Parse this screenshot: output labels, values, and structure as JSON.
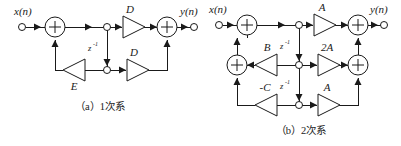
{
  "figure": {
    "background_color": "#ffffff",
    "line_color": "#1a1a1a",
    "panels": [
      {
        "id": "a",
        "caption": "（a）1次系",
        "caption_label": "(a)",
        "caption_text": "1次系",
        "input_label": "x(n)",
        "output_label": "y(n)",
        "delay_labels": [
          "z-1"
        ],
        "delay_base": "z",
        "delay_exponent": "-1",
        "gain_labels": [
          "D",
          "D",
          "E"
        ],
        "adder_symbols": [
          "+",
          "+"
        ],
        "node_count": 2
      },
      {
        "id": "b",
        "caption": "（b）2次系",
        "caption_label": "(b)",
        "caption_text": "2次系",
        "input_label": "x(n)",
        "output_label": "y(n)",
        "delay_labels": [
          "z-1",
          "z-1"
        ],
        "delay_base": "z",
        "delay_exponent": "-1",
        "gain_labels": [
          "A",
          "2A",
          "A",
          "B",
          "-C"
        ],
        "adder_symbols": [
          "+",
          "+",
          "+",
          "+"
        ],
        "node_count": 3
      }
    ]
  },
  "panel_a": {
    "input_label": "x(n)",
    "output_label": "y(n)",
    "adder_in": "+",
    "adder_out": "+",
    "z_base": "z",
    "z_exp": "-1",
    "gain_top": "D",
    "gain_bottom": "D",
    "gain_feedback": "E",
    "caption": "（a）1次系"
  },
  "panel_b": {
    "input_label": "x(n)",
    "output_label": "y(n)",
    "adder_in_top": "+",
    "adder_in_mid": "+",
    "adder_out_top": "+",
    "adder_out_mid": "+",
    "z_base_1": "z",
    "z_exp_1": "-1",
    "z_base_2": "z",
    "z_exp_2": "-1",
    "gain_top": "A",
    "gain_mid": "2A",
    "gain_bottom": "A",
    "gain_fb_mid": "B",
    "gain_fb_bottom": "-C",
    "caption": "（b）2次系"
  }
}
